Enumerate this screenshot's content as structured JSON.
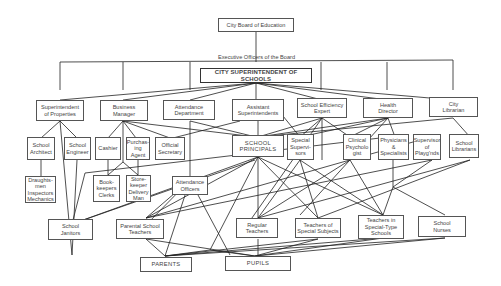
{
  "title": "City Board of Education",
  "board_label": "Executive Officers of the Board",
  "nodes": {
    "board": "City Board of Education",
    "superintendent": "CITY SUPERINTENDENT OF SCHOOLS",
    "sup_properties": "Superintendent\nof Properties",
    "business_manager": "Business\nManager",
    "attendance_dept": "Attendance\nDepartment",
    "asst_superintendents": "Assistant\nSuperintendents",
    "efficiency_expert": "School Efficiency\nExpert",
    "health_director": "Health\nDirector",
    "city_librarian": "City\nLibrarian",
    "school_architect": "School\nArchitect",
    "school_engineer": "School\nEngineer",
    "cashier": "Cashier",
    "purchasing_agent": "Purchas-\ning\nAgent",
    "official_secretary": "Official\nSecretary",
    "school_principals": "SCHOOL\nPRINCIPALS",
    "special_supervisors": "Special\nSupervi-\nsors",
    "clinical_psychologist": "Clinical\nPsycholo\ngist",
    "physicians": "Physicians\n&\nSpecialists",
    "supervisor_playgrounds": "Supervisor\nof\nPlayg'nds",
    "school_librarians": "School\nLibrarians",
    "draughtsmen": "Draughts-\nmen\nInspectors\nMechanics",
    "bookkeepers": "Book-\nkeepers\nClerks",
    "storekeeper": "Store-\nkeeper\nDelivery\nMan",
    "attendance_officers": "Attendance\nOfficers",
    "school_janitors": "School\nJanitors",
    "parental_teachers": "Parental School\nTeachers",
    "regular_teachers": "Regular\nTeachers",
    "special_subject_teachers": "Teachers of\nSpecial Subjects",
    "special_type_teachers": "Teachers in\nSpecial-Type\nSchools",
    "school_nurses": "School\nNurses",
    "parents": "PARENTS",
    "pupils": "PUPILS"
  },
  "colors": {
    "line": "#222222",
    "border": "#555555",
    "background": "#ffffff"
  }
}
